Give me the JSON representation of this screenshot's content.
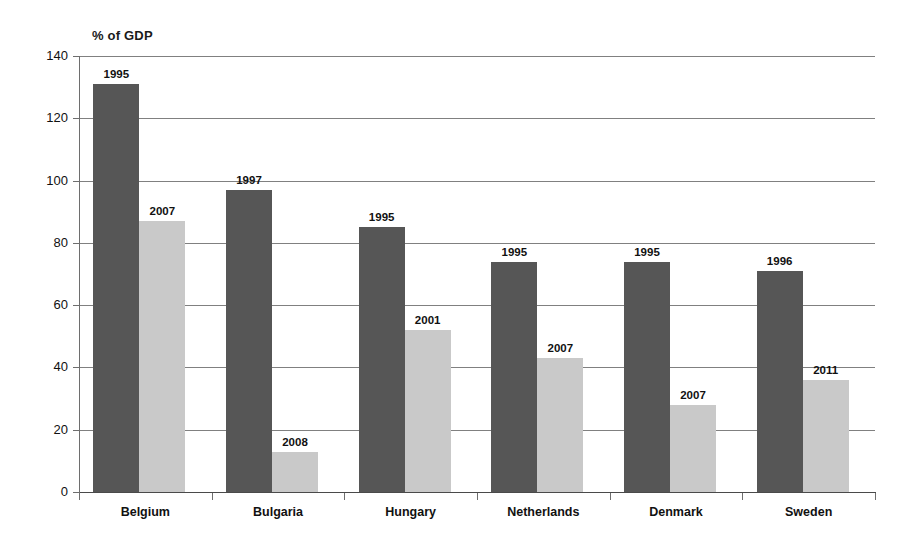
{
  "chart_data": {
    "type": "bar",
    "title": "",
    "ylabel": "% of GDP",
    "xlabel": "",
    "ylim": [
      0,
      140
    ],
    "ytick_step": 20,
    "yticks": [
      0,
      20,
      40,
      60,
      80,
      100,
      120,
      140
    ],
    "grid": true,
    "legend": "none",
    "categories": [
      "Belgium",
      "Bulgaria",
      "Hungary",
      "Netherlands",
      "Denmark",
      "Sweden"
    ],
    "series": [
      {
        "name": "earlier-year",
        "color": "#565656",
        "values": [
          131,
          97,
          85,
          74,
          74,
          71
        ],
        "point_labels": [
          "1995",
          "1997",
          "1995",
          "1995",
          "1995",
          "1996"
        ]
      },
      {
        "name": "later-year",
        "color": "#c9c9c9",
        "values": [
          87,
          13,
          52,
          43,
          28,
          36
        ],
        "point_labels": [
          "2007",
          "2008",
          "2001",
          "2007",
          "2007",
          "2011"
        ]
      }
    ]
  },
  "colors": {
    "dark_bar": "#565656",
    "light_bar": "#c9c9c9",
    "gridline": "#808080",
    "axis": "#4a4a4a",
    "background": "#ffffff"
  }
}
